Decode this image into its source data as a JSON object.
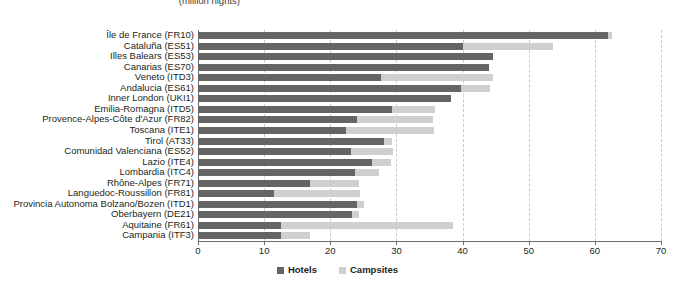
{
  "chart_data": {
    "type": "bar",
    "orientation": "horizontal",
    "stacked": true,
    "title": "(million nights)",
    "xlabel": "",
    "ylabel": "",
    "xlim": [
      0,
      70
    ],
    "xticks": [
      0,
      10,
      20,
      30,
      40,
      50,
      60,
      70
    ],
    "xtick_labels": [
      "0",
      "10",
      "20",
      "30",
      "40",
      "50",
      "60",
      "70"
    ],
    "grid": true,
    "legend_position": "bottom",
    "colors": {
      "hotels": "#656565",
      "campsites": "#cfcfcf",
      "axis": "#6d6d6d",
      "gridline": "#c9c9c9",
      "text": "#231f20"
    },
    "categories": [
      "Île de France (FR10)",
      "Cataluña (ES51)",
      "Illes Balears (ES53)",
      "Canarias (ES70)",
      "Veneto (ITD3)",
      "Andalucia (ES61)",
      "Inner London (UKI1)",
      "Emilia-Romagna (ITD5)",
      "Provence-Alpes-Côte d'Azur (FR82)",
      "Toscana (ITE1)",
      "Tirol (AT33)",
      "Comunidad Valenciana (ES52)",
      "Lazio (ITE4)",
      "Lombardia (ITC4)",
      "Rhône-Alpes (FR71)",
      "Languedoc-Roussillon (FR81)",
      "Provincia Autonoma Bolzano/Bozen (ITD1)",
      "Oberbayern (DE21)",
      "Aquitaine (FR61)",
      "Campania (ITF3)"
    ],
    "series": [
      {
        "name": "Hotels",
        "color": "#656565",
        "values": [
          62.0,
          40.1,
          44.6,
          44.0,
          27.6,
          39.8,
          38.3,
          29.4,
          24.0,
          22.4,
          28.1,
          23.2,
          26.3,
          23.8,
          17.0,
          11.5,
          24.0,
          23.3,
          12.5,
          12.5
        ]
      },
      {
        "name": "Campsites",
        "color": "#cfcfcf",
        "values": [
          0.6,
          13.5,
          0.0,
          0.0,
          17.0,
          4.3,
          0.0,
          6.4,
          11.5,
          13.3,
          1.3,
          6.3,
          2.9,
          3.5,
          7.3,
          13.0,
          1.1,
          1.0,
          26.0,
          4.5
        ]
      }
    ],
    "totals": [
      62.6,
      53.6,
      44.6,
      44.0,
      44.6,
      44.1,
      38.3,
      35.8,
      35.5,
      35.7,
      29.4,
      29.5,
      29.2,
      27.3,
      24.3,
      24.5,
      25.1,
      24.3,
      38.5,
      17.0
    ]
  },
  "legend": {
    "items": [
      {
        "label": "Hotels",
        "color": "#656565"
      },
      {
        "label": "Campsites",
        "color": "#cfcfcf"
      }
    ]
  }
}
